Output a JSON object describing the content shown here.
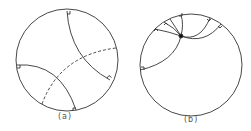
{
  "figure": {
    "panels": [
      {
        "id": "a",
        "label": "(a)",
        "disk": {
          "cx": 67,
          "cy": 60,
          "r": 51
        },
        "description": "Poincaré disk with two solid geodesics meeting boundary at right angles and one dashed geodesic crossing both"
      },
      {
        "id": "b",
        "label": "(b)",
        "disk": {
          "cx": 191,
          "cy": 65,
          "r": 51
        },
        "description": "Poincaré disk with several geodesics through a common marked point, each meeting boundary at right angles"
      }
    ],
    "colors": {
      "stroke": "#333333",
      "background": "#ffffff"
    }
  }
}
